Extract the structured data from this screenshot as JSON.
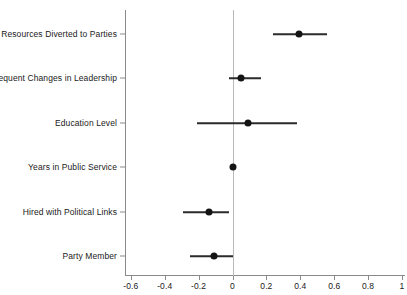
{
  "chart_data": {
    "type": "scatter",
    "title": "",
    "xlabel": "",
    "ylabel": "",
    "grid": false,
    "legend": "none",
    "orientation": "horizontal",
    "reference_line": 0,
    "xlim": [
      -0.7,
      1.05
    ],
    "xticks": [
      -0.6,
      -0.4,
      -0.2,
      0,
      0.2,
      0.4,
      0.6,
      0.8,
      1
    ],
    "xticklabels": [
      "-0.6",
      "-0.4",
      "-0.2",
      "0",
      "0.2",
      "0.4",
      "0.6",
      "0.8",
      "1"
    ],
    "categories": [
      "Resources Diverted to Parties",
      "Frequent Changes in Leadership",
      "Education Level",
      "Years in Public Service",
      "Hired with Political Links",
      "Party Member"
    ],
    "values": [
      0.39,
      0.05,
      0.09,
      0.0,
      -0.14,
      -0.11
    ],
    "ci_low": [
      0.24,
      -0.02,
      -0.21,
      0.0,
      -0.29,
      -0.25
    ],
    "ci_high": [
      0.56,
      0.17,
      0.38,
      0.0,
      -0.02,
      0.0
    ],
    "points": [
      {
        "label": "Resources Diverted to Parties",
        "estimate": 0.39,
        "ci_low": 0.24,
        "ci_high": 0.56
      },
      {
        "label": "Frequent Changes in Leadership",
        "estimate": 0.05,
        "ci_low": -0.02,
        "ci_high": 0.17
      },
      {
        "label": "Education Level",
        "estimate": 0.09,
        "ci_low": -0.21,
        "ci_high": 0.38
      },
      {
        "label": "Years in Public Service",
        "estimate": 0.0,
        "ci_low": 0.0,
        "ci_high": 0.0
      },
      {
        "label": "Hired with Political Links",
        "estimate": -0.14,
        "ci_low": -0.29,
        "ci_high": -0.02
      },
      {
        "label": "Party Member",
        "estimate": -0.11,
        "ci_low": -0.25,
        "ci_high": 0.0
      }
    ],
    "colors": {
      "point": "#141414",
      "ci": "#2b2b2b",
      "axis": "#8a8a8a",
      "reference": "#b9b9b9",
      "text": "#1a1a1a",
      "background": "#ffffff"
    }
  }
}
